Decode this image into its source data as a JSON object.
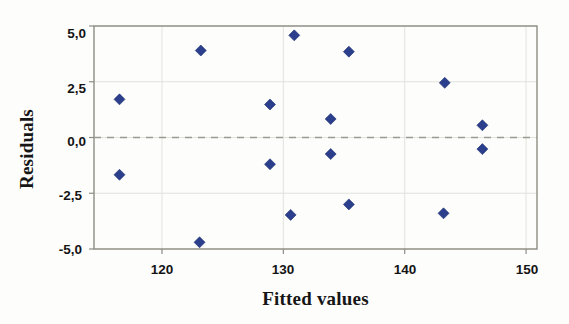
{
  "chart_data": {
    "type": "scatter",
    "title": "",
    "xlabel": "Fitted values",
    "ylabel": "Residuals",
    "xlim": [
      114.4,
      150.9
    ],
    "ylim": [
      -5.0,
      5.0
    ],
    "xticks": [
      120,
      130,
      140,
      150
    ],
    "xtick_labels": [
      "120",
      "130",
      "140",
      "150"
    ],
    "yticks": [
      5.0,
      2.5,
      0.0,
      -2.5,
      -5.0
    ],
    "ytick_labels": [
      "5,0",
      "2,5",
      "0,0",
      "-2,5",
      "-5,0"
    ],
    "grid": "light gridlines at y ticks and x ticks",
    "reference_line": {
      "orientation": "horizontal",
      "y": 0.0,
      "style": "dashed",
      "color": "#9a9a93"
    },
    "marker": {
      "shape": "diamond",
      "color": "#2b3f8c",
      "edge_color": "#1d2f6e",
      "size": 11
    },
    "legend": null,
    "points": [
      {
        "x": 116.5,
        "y": 1.71
      },
      {
        "x": 116.5,
        "y": -1.67
      },
      {
        "x": 123.2,
        "y": 3.9
      },
      {
        "x": 123.1,
        "y": -4.7
      },
      {
        "x": 128.9,
        "y": 1.48
      },
      {
        "x": 128.9,
        "y": -1.2
      },
      {
        "x": 130.9,
        "y": 4.58
      },
      {
        "x": 130.6,
        "y": -3.47
      },
      {
        "x": 133.9,
        "y": 0.83
      },
      {
        "x": 133.9,
        "y": -0.74
      },
      {
        "x": 135.4,
        "y": 3.85
      },
      {
        "x": 135.4,
        "y": -3.0
      },
      {
        "x": 143.3,
        "y": 2.45
      },
      {
        "x": 143.2,
        "y": -3.4
      },
      {
        "x": 146.4,
        "y": 0.55
      },
      {
        "x": 146.4,
        "y": -0.52
      }
    ]
  },
  "axes": {
    "x_title": "Fitted values",
    "y_title": "Residuals",
    "x_tick_0": "120",
    "x_tick_1": "130",
    "x_tick_2": "140",
    "x_tick_3": "150",
    "y_tick_0": "5,0",
    "y_tick_1": "2,5",
    "y_tick_2": "0,0",
    "y_tick_3": "-2,5",
    "y_tick_4": "-5,0"
  },
  "colors": {
    "marker": "#2b3f8c",
    "frame": "#8d8d85",
    "grid": "#e2e2dc",
    "zero_line": "#9a9a93",
    "background": "#fdfdfc"
  }
}
